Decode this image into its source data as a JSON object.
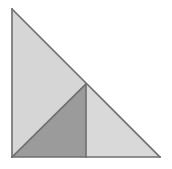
{
  "figure": {
    "name": "subdivided-right-triangle",
    "background_color": "#ffffff",
    "canvas": {
      "width": 172,
      "height": 169
    },
    "outline_color": "#6e6e6e",
    "outline_width": 1.6,
    "vertices": {
      "apex_top_left": [
        12,
        9
      ],
      "bottom_left": [
        12,
        157
      ],
      "bottom_right": [
        160,
        157
      ],
      "hypotenuse_midpoint": [
        86,
        84
      ],
      "base_midpoint": [
        86,
        157
      ]
    },
    "regions": [
      {
        "id": "upper-left-triangle",
        "label": "Large light gray triangle",
        "fill": "#d6d6d6",
        "points": "12,9 86,84 12,157"
      },
      {
        "id": "middle-dark-triangle",
        "label": "Dark gray triangle",
        "fill": "#9b9b9b",
        "points": "12,157 86,84 86,157"
      },
      {
        "id": "lower-right-triangle",
        "label": "Right light gray triangle",
        "fill": "#d9d9d9",
        "points": "86,84 160,157 86,157"
      }
    ],
    "edges": [
      {
        "id": "left-leg",
        "from": [
          12,
          9
        ],
        "to": [
          12,
          157
        ]
      },
      {
        "id": "base",
        "from": [
          12,
          157
        ],
        "to": [
          160,
          157
        ]
      },
      {
        "id": "hypotenuse",
        "from": [
          12,
          9
        ],
        "to": [
          160,
          157
        ]
      },
      {
        "id": "inner-diagonal",
        "from": [
          12,
          157
        ],
        "to": [
          86,
          84
        ]
      },
      {
        "id": "inner-vertical",
        "from": [
          86,
          84
        ],
        "to": [
          86,
          157
        ]
      }
    ]
  }
}
